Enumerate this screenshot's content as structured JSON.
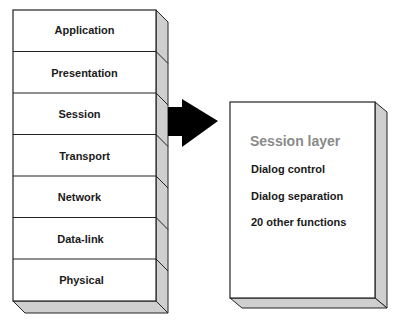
{
  "stack": {
    "layers": [
      {
        "label": "Application"
      },
      {
        "label": "Presentation"
      },
      {
        "label": "Session"
      },
      {
        "label": "Transport"
      },
      {
        "label": "Network"
      },
      {
        "label": "Data-link"
      },
      {
        "label": "Physical"
      }
    ]
  },
  "arrow": {
    "direction": "right",
    "color": "#000000"
  },
  "detail_box": {
    "title": "Session layer",
    "functions": [
      "Dialog control",
      "Dialog separation",
      "20 other functions"
    ]
  },
  "colors": {
    "face": "#ffffff",
    "side": "#cfcfcf",
    "outline": "#222222",
    "title": "#8a8a8a"
  }
}
